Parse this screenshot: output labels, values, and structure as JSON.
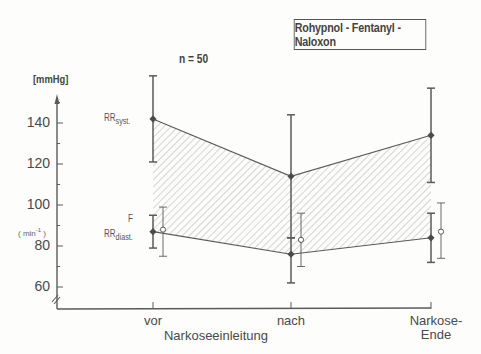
{
  "figure": {
    "title_box": "Rohypnol - Fentanyl - Naloxon",
    "sample_label": "n = 50",
    "y_unit_pressure": "[mmHg]",
    "y_unit_rate": "( min",
    "y_unit_rate_exp": "-1",
    "y_unit_rate_close": " )",
    "series_labels": {
      "syst_main": "RR",
      "syst_sub": "syst.",
      "f": "F",
      "diast_main": "RR",
      "diast_sub": "diast."
    },
    "x_ticks": [
      "vor",
      "nach",
      "Narkose-"
    ],
    "x_tick_extra": "Ende",
    "x_group_label": "Narkoseeinleitung",
    "y_ticks": [
      "140",
      "120",
      "100",
      "80",
      "60"
    ]
  },
  "chart_data": {
    "type": "line",
    "title": "Rohypnol - Fentanyl - Naloxon",
    "subtitle": "n = 50",
    "xlabel": "Narkoseeinleitung",
    "ylabel": "[mmHg] / (min-1)",
    "categories": [
      "vor Narkoseeinleitung",
      "nach Narkoseeinleitung",
      "Narkose-Ende"
    ],
    "ylim": [
      50,
      170
    ],
    "yticks": [
      60,
      80,
      100,
      120,
      140
    ],
    "grid": false,
    "legend": "inline labels left of first category",
    "shaded_region": "hatched area between RR syst. and RR diast.",
    "series": [
      {
        "name": "RR syst.",
        "marker": "filled",
        "values": [
          142,
          114,
          134
        ],
        "sd_low": [
          121,
          84,
          111
        ],
        "sd_high": [
          163,
          144,
          157
        ]
      },
      {
        "name": "RR diast.",
        "marker": "filled",
        "values": [
          87,
          76,
          84
        ],
        "sd_low": [
          79,
          62,
          72
        ],
        "sd_high": [
          95,
          84,
          96
        ]
      },
      {
        "name": "F",
        "marker": "open",
        "values": [
          88,
          83,
          87
        ],
        "sd_low": [
          75,
          70,
          74
        ],
        "sd_high": [
          99,
          96,
          101
        ]
      }
    ]
  },
  "colors": {
    "ink": "#4a4a4a",
    "line": "#5a5a5a",
    "hatch": "#9a9a9a",
    "background": "#fdfdfb"
  }
}
